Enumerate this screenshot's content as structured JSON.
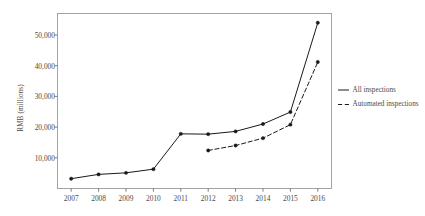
{
  "chart_data": {
    "type": "line",
    "title": "",
    "xlabel": "",
    "ylabel": "RMB (millions)",
    "x": [
      2007,
      2008,
      2009,
      2010,
      2011,
      2012,
      2013,
      2014,
      2015,
      2016
    ],
    "xtick_labels": [
      "2007",
      "2008",
      "2009",
      "2010",
      "2011",
      "2012",
      "2013",
      "2014",
      "2015",
      "2016"
    ],
    "ytick_labels": [
      "10,000",
      "20,000",
      "30,000",
      "40,000",
      "50,000"
    ],
    "yticks": [
      10000,
      20000,
      30000,
      40000,
      50000
    ],
    "ylim": [
      0,
      57000
    ],
    "xlim": [
      2006.5,
      2016.5
    ],
    "grid": false,
    "legend_position": "right",
    "series": [
      {
        "name": "All inspections",
        "style": "solid",
        "color": "#1a1a1a",
        "x": [
          2007,
          2008,
          2009,
          2010,
          2011,
          2012,
          2013,
          2014,
          2015,
          2016
        ],
        "values": [
          3200,
          4600,
          5100,
          6300,
          17800,
          17700,
          18600,
          21000,
          24900,
          54000
        ]
      },
      {
        "name": "Automated inspections",
        "style": "dashed",
        "color": "#1a1a1a",
        "x": [
          2012,
          2013,
          2014,
          2015,
          2016
        ],
        "values": [
          12400,
          14000,
          16400,
          20800,
          41200
        ]
      }
    ]
  },
  "legend": {
    "items": [
      {
        "label": "All inspections",
        "style": "solid"
      },
      {
        "label": "Automated inspections",
        "style": "dashed"
      }
    ]
  }
}
